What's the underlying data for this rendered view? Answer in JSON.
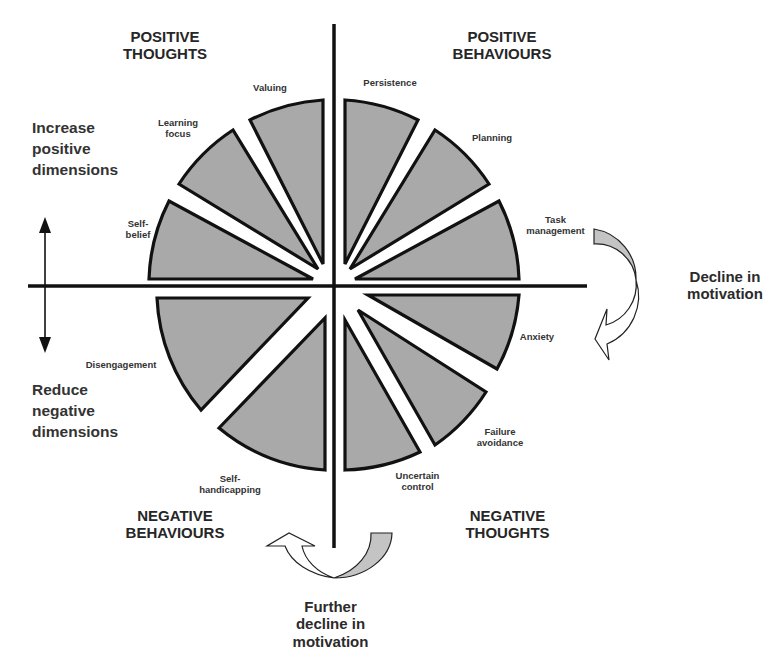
{
  "quadrants": {
    "positive_thoughts": "POSITIVE\nTHOUGHTS",
    "positive_behaviours": "POSITIVE\nBEHAVIOURS",
    "negative_behaviours": "NEGATIVE\nBEHAVIOURS",
    "negative_thoughts": "NEGATIVE\nTHOUGHTS"
  },
  "side_labels": {
    "increase": "Increase\npositive\ndimensions",
    "reduce": "Reduce\nnegative\ndimensions"
  },
  "motivation_labels": {
    "decline": "Decline in\nmotivation",
    "further_decline": "Further\ndecline in\nmotivation"
  },
  "wedges": [
    {
      "id": "valuing",
      "label": "Valuing",
      "quadrant": "positive_thoughts"
    },
    {
      "id": "learning-focus",
      "label": "Learning\nfocus",
      "quadrant": "positive_thoughts"
    },
    {
      "id": "self-belief",
      "label": "Self-\nbelief",
      "quadrant": "positive_thoughts"
    },
    {
      "id": "persistence",
      "label": "Persistence",
      "quadrant": "positive_behaviours"
    },
    {
      "id": "planning",
      "label": "Planning",
      "quadrant": "positive_behaviours"
    },
    {
      "id": "task-management",
      "label": "Task\nmanagement",
      "quadrant": "positive_behaviours"
    },
    {
      "id": "anxiety",
      "label": "Anxiety",
      "quadrant": "negative_thoughts"
    },
    {
      "id": "failure-avoidance",
      "label": "Failure\navoidance",
      "quadrant": "negative_thoughts"
    },
    {
      "id": "uncertain-control",
      "label": "Uncertain\ncontrol",
      "quadrant": "negative_thoughts"
    },
    {
      "id": "self-handicapping",
      "label": "Self-\nhandicapping",
      "quadrant": "negative_behaviours"
    },
    {
      "id": "disengagement",
      "label": "Disengagement",
      "quadrant": "negative_behaviours"
    }
  ],
  "colors": {
    "wedge_fill": "#a9a9a9",
    "arrow_fill": "#c4c4c4",
    "stroke": "#111111"
  }
}
